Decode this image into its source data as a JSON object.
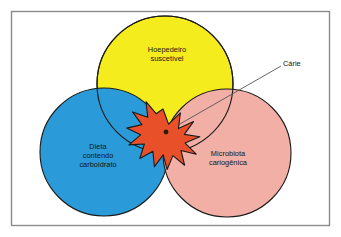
{
  "figure": {
    "type": "venn-diagram",
    "caption_language": "pt-BR",
    "frame": {
      "border_color": "#8a8a8a",
      "background_color": "#ffffff"
    },
    "circles": [
      {
        "id": "host",
        "label": "Hoepedeiro\nsuscetível",
        "color": "#f5ec1d",
        "outline_color": "#1a1a1a",
        "cx": 165,
        "cy": 84,
        "r": 68
      },
      {
        "id": "diet",
        "label": "Dieta\ncontendo\ncarboidrato",
        "color": "#2a9bd8",
        "outline_color": "#1a1a1a",
        "cx": 104,
        "cy": 152,
        "r": 64
      },
      {
        "id": "microbiota",
        "label": "Microbiota\ncariogênica",
        "color": "#f2afa6",
        "outline_color": "#1a1a1a",
        "cx": 227,
        "cy": 153,
        "r": 64
      }
    ],
    "intersection_marker": {
      "shape": "starburst",
      "fill_color": "#e8502a",
      "outline_color": "#1a1a1a",
      "cx": 163,
      "cy": 134,
      "outer_radius": 25,
      "inner_radius": 13,
      "points": 11
    },
    "callout": {
      "label": "Cárie",
      "leader_line_color": "#555555",
      "from_x": 163,
      "from_y": 134,
      "to_x": 281,
      "to_y": 66,
      "dot_color": "#2b1a10"
    }
  }
}
